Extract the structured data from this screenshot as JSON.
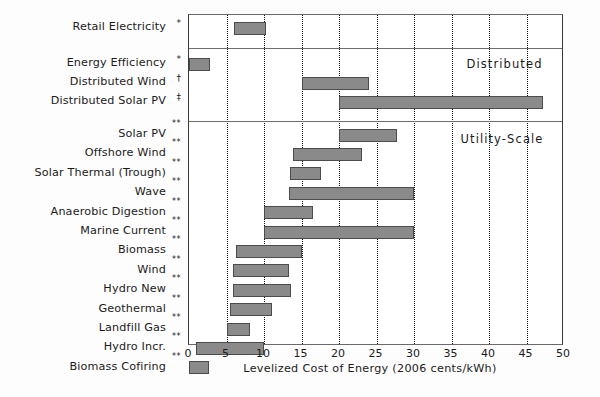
{
  "chart_data": {
    "type": "bar",
    "orientation": "horizontal",
    "subtype": "range-bar",
    "title": "",
    "xlabel": "Levelized Cost of Energy (2006 cents/kWh)",
    "ylabel": "",
    "xlim": [
      0,
      50
    ],
    "xticks": [
      0,
      5,
      10,
      15,
      20,
      25,
      30,
      35,
      40,
      45,
      50
    ],
    "xtick_labels": [
      "0",
      "5",
      "10",
      "15",
      "20",
      "25",
      "30",
      "35",
      "40",
      "45",
      "50"
    ],
    "grid": "vertical dotted at every 5 units",
    "legend": "none",
    "group_labels": [
      "Distributed",
      "Utility-Scale"
    ],
    "categories": [
      "Retail Electricity",
      "Energy Efficiency",
      "Distributed Wind",
      "Distributed Solar PV",
      "Solar PV",
      "Offshore Wind",
      "Solar Thermal (Trough)",
      "Wave",
      "Anaerobic Digestion",
      "Marine Current",
      "Biomass",
      "Wind",
      "Hydro New",
      "Geothermal",
      "Landfill Gas",
      "Hydro Incr.",
      "Biomass Cofiring"
    ],
    "ranges": [
      [
        6.0,
        10.2
      ],
      [
        0.0,
        2.8
      ],
      [
        15.0,
        24.0
      ],
      [
        20.0,
        47.2
      ],
      [
        20.0,
        27.7
      ],
      [
        13.8,
        23.0
      ],
      [
        13.5,
        17.6
      ],
      [
        13.3,
        30.0
      ],
      [
        10.0,
        16.5
      ],
      [
        10.0,
        30.0
      ],
      [
        6.3,
        15.0
      ],
      [
        5.9,
        13.3
      ],
      [
        5.8,
        13.6
      ],
      [
        5.4,
        11.0
      ],
      [
        5.0,
        8.1
      ],
      [
        0.9,
        10.0
      ],
      [
        0.0,
        2.6
      ]
    ],
    "footnote_markers": [
      "*",
      "*",
      "†",
      "‡",
      "**",
      "**",
      "**",
      "**",
      "**",
      "**",
      "**",
      "**",
      "**",
      "**",
      "**",
      "**",
      "**"
    ],
    "bar_color": "#8a8a8a",
    "bar_edge_color": "#4c4c4c",
    "gridline_color": "#111111",
    "axis_color": "#3a3a3a"
  },
  "rows": [
    {
      "label": "Retail Electricity",
      "marker": "*",
      "start": 6.0,
      "end": 10.2,
      "group": "retail"
    },
    {
      "label": "Energy Efficiency",
      "marker": "*",
      "start": 0.0,
      "end": 2.8,
      "group": "distributed"
    },
    {
      "label": "Distributed Wind",
      "marker": "†",
      "start": 15.0,
      "end": 24.0,
      "group": "distributed"
    },
    {
      "label": "Distributed Solar PV",
      "marker": "‡",
      "start": 20.0,
      "end": 47.2,
      "group": "distributed"
    },
    {
      "label": "Solar PV",
      "marker": "**",
      "start": 20.0,
      "end": 27.7,
      "group": "utility"
    },
    {
      "label": "Offshore Wind",
      "marker": "**",
      "start": 13.8,
      "end": 23.0,
      "group": "utility"
    },
    {
      "label": "Solar Thermal (Trough)",
      "marker": "**",
      "start": 13.5,
      "end": 17.6,
      "group": "utility"
    },
    {
      "label": "Wave",
      "marker": "**",
      "start": 13.3,
      "end": 30.0,
      "group": "utility"
    },
    {
      "label": "Anaerobic Digestion",
      "marker": "**",
      "start": 10.0,
      "end": 16.5,
      "group": "utility"
    },
    {
      "label": "Marine Current",
      "marker": "**",
      "start": 10.0,
      "end": 30.0,
      "group": "utility"
    },
    {
      "label": "Biomass",
      "marker": "**",
      "start": 6.3,
      "end": 15.0,
      "group": "utility"
    },
    {
      "label": "Wind",
      "marker": "**",
      "start": 5.9,
      "end": 13.3,
      "group": "utility"
    },
    {
      "label": "Hydro New",
      "marker": "**",
      "start": 5.8,
      "end": 13.6,
      "group": "utility"
    },
    {
      "label": "Geothermal",
      "marker": "**",
      "start": 5.4,
      "end": 11.0,
      "group": "utility"
    },
    {
      "label": "Landfill Gas",
      "marker": "**",
      "start": 5.0,
      "end": 8.1,
      "group": "utility"
    },
    {
      "label": "Hydro Incr.",
      "marker": "**",
      "start": 0.9,
      "end": 10.0,
      "group": "utility"
    },
    {
      "label": "Biomass Cofiring",
      "marker": "**",
      "start": 0.0,
      "end": 2.6,
      "group": "utility"
    }
  ],
  "groups": {
    "distributed_label": "Distributed",
    "utility_label": "Utility-Scale"
  },
  "axis": {
    "title": "Levelized Cost of Energy (2006 cents/kWh)",
    "ticks": [
      "0",
      "5",
      "10",
      "15",
      "20",
      "25",
      "30",
      "35",
      "40",
      "45",
      "50"
    ]
  }
}
